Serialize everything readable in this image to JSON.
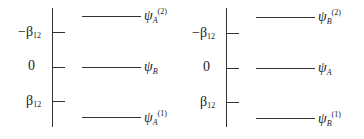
{
  "diagram": {
    "type": "energy-level-diagram",
    "panels": [
      {
        "axis_labels": [
          {
            "symbol": "−β",
            "sub": "12",
            "text": "−β12"
          },
          {
            "symbol": "0",
            "sub": "",
            "text": "0"
          },
          {
            "symbol": "β",
            "sub": "12",
            "text": "β12"
          }
        ],
        "levels": [
          {
            "psi": "ψ",
            "sub": "A",
            "sup": "(2)",
            "text": "ψA(2)"
          },
          {
            "psi": "ψ",
            "sub": "B",
            "sup": "",
            "text": "ψB"
          },
          {
            "psi": "ψ",
            "sub": "A",
            "sup": "(1)",
            "text": "ψA(1)"
          }
        ]
      },
      {
        "axis_labels": [
          {
            "symbol": "−β",
            "sub": "12",
            "text": "−β12"
          },
          {
            "symbol": "0",
            "sub": "",
            "text": "0"
          },
          {
            "symbol": "β",
            "sub": "12",
            "text": "β12"
          }
        ],
        "levels": [
          {
            "psi": "ψ",
            "sub": "B",
            "sup": "(2)",
            "text": "ψB(2)"
          },
          {
            "psi": "ψ",
            "sub": "A",
            "sup": "",
            "text": "ψA"
          },
          {
            "psi": "ψ",
            "sub": "B",
            "sup": "(1)",
            "text": "ψB(1)"
          }
        ]
      }
    ]
  }
}
